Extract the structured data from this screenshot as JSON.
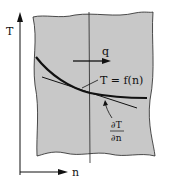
{
  "diagram": {
    "axis_y_label": "T",
    "axis_x_label": "n",
    "flux_label": "q",
    "curve_label": "T = f(n)",
    "gradient_numerator": "∂T",
    "gradient_denominator": "∂n",
    "colors": {
      "region_fill": "#c8c8c8",
      "stroke": "#111111",
      "background": "#ffffff"
    }
  }
}
